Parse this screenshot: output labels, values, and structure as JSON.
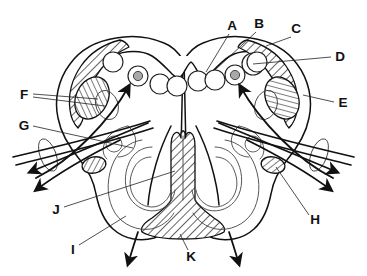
{
  "figure": {
    "background_color": "#ffffff",
    "line_color": "#111111",
    "hatch_color": "#111111",
    "nucleus_core_color": "#a8a8a8",
    "width": 367,
    "height": 276
  },
  "labels": [
    {
      "id": "A",
      "text": "A",
      "x": 232,
      "y": 26,
      "anchor": "middle",
      "target_x": 206,
      "target_y": 72
    },
    {
      "id": "B",
      "text": "B",
      "x": 259,
      "y": 24,
      "anchor": "middle",
      "target_x": 216,
      "target_y": 70
    },
    {
      "id": "C",
      "text": "C",
      "x": 296,
      "y": 29,
      "anchor": "middle",
      "target_x": 265,
      "target_y": 45
    },
    {
      "id": "D",
      "text": "D",
      "x": 340,
      "y": 57,
      "anchor": "middle",
      "target_x": 254,
      "target_y": 65
    },
    {
      "id": "E",
      "text": "E",
      "x": 343,
      "y": 103,
      "anchor": "middle",
      "target_x": 304,
      "target_y": 94
    },
    {
      "id": "F",
      "text": "F",
      "x": 24,
      "y": 95,
      "anchor": "middle",
      "target_x": 96,
      "target_y": 99
    },
    {
      "id": "G",
      "text": "G",
      "x": 24,
      "y": 126,
      "anchor": "middle",
      "target_x": 132,
      "target_y": 147
    },
    {
      "id": "H",
      "text": "H",
      "x": 315,
      "y": 220,
      "anchor": "middle",
      "target_x": 283,
      "target_y": 166
    },
    {
      "id": "I",
      "text": "I",
      "x": 73,
      "y": 250,
      "anchor": "middle",
      "target_x": 124,
      "target_y": 217
    },
    {
      "id": "J",
      "text": "J",
      "x": 56,
      "y": 210,
      "anchor": "middle",
      "target_x": 173,
      "target_y": 172
    },
    {
      "id": "K",
      "text": "K",
      "x": 191,
      "y": 257,
      "anchor": "middle",
      "target_x": 179,
      "target_y": 234
    }
  ],
  "structures": {
    "outer_boundary": "bilobed butterfly outline",
    "central_column": "vertical hatched median stem widening into a hatched basal triangle",
    "hatched_caps": [
      "left dorsolateral cap",
      "right dorsolateral cap"
    ],
    "hatched_ovals": [
      "left ventral oval",
      "right ventral oval",
      "left small oval",
      "right small oval"
    ],
    "nuclei_row_count": 6,
    "cored_nuclei_count": 2,
    "arrow_count": 8
  }
}
